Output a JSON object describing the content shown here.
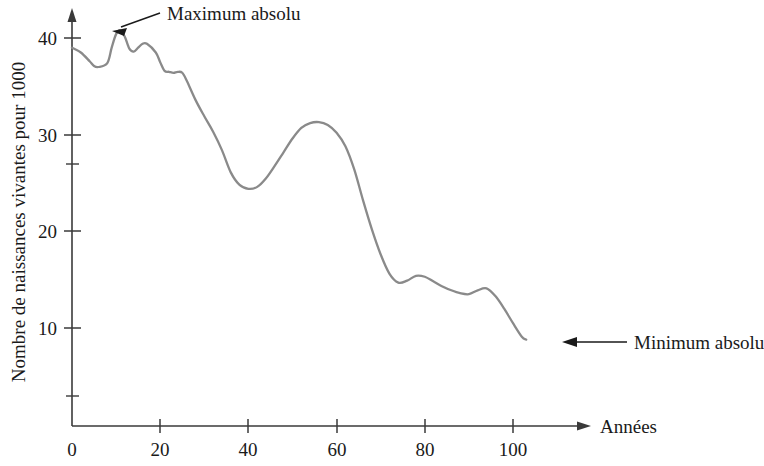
{
  "chart_data": {
    "type": "line",
    "title": "",
    "subtitle": "",
    "xlabel": "Années",
    "ylabel": "Nombre de naissances vivantes pour 1000",
    "xlim": [
      0,
      106
    ],
    "ylim": [
      0,
      43
    ],
    "xticks": [
      0,
      20,
      40,
      60,
      80,
      100
    ],
    "xtick_labels": [
      "0",
      "20",
      "40",
      "60",
      "80",
      "100"
    ],
    "yticks": [
      10,
      20,
      30,
      40
    ],
    "ytick_labels": [
      "10",
      "20",
      "30",
      "40"
    ],
    "yticks_minor": [
      27
    ],
    "grid": false,
    "legend": false,
    "series": [
      {
        "name": "Taux de natalité",
        "color": "#8a8a8a",
        "x": [
          0,
          2,
          4,
          5,
          6,
          8,
          9,
          10,
          11,
          12,
          13,
          14,
          15,
          16,
          17,
          19,
          20,
          21,
          22,
          23,
          24,
          25,
          26,
          28,
          30,
          32,
          34,
          36,
          38,
          40,
          42,
          44,
          46,
          48,
          50,
          52,
          54,
          56,
          58,
          60,
          62,
          64,
          66,
          68,
          70,
          72,
          74,
          76,
          78,
          80,
          82,
          84,
          86,
          88,
          90,
          92,
          94,
          96,
          98,
          100,
          102,
          103
        ],
        "y": [
          39.0,
          38.5,
          37.6,
          37.1,
          37.0,
          37.4,
          39.0,
          40.4,
          40.8,
          40.1,
          38.9,
          38.6,
          39.0,
          39.4,
          39.4,
          38.5,
          37.5,
          36.6,
          36.5,
          36.4,
          36.5,
          36.4,
          35.6,
          33.6,
          31.9,
          30.3,
          28.4,
          26.1,
          24.8,
          24.4,
          24.6,
          25.5,
          26.8,
          28.2,
          29.6,
          30.7,
          31.2,
          31.3,
          31.0,
          30.2,
          28.8,
          26.4,
          23.2,
          20.2,
          17.6,
          15.6,
          14.7,
          14.9,
          15.4,
          15.3,
          14.8,
          14.3,
          13.9,
          13.6,
          13.5,
          13.9,
          14.1,
          13.3,
          12.0,
          10.5,
          9.1,
          8.8
        ]
      }
    ],
    "annotations": [
      {
        "id": "maximum",
        "text": "Maximum absolu",
        "target_x": 11,
        "target_y": 40.8,
        "text_x": 39,
        "text_y": 42.6
      },
      {
        "id": "minimum",
        "text": "Minimum absolu",
        "target_x": 103,
        "target_y": 8.8,
        "text_x": 137,
        "text_y": 8.8
      }
    ]
  },
  "axes": {
    "y_axis_title": "Nombre de naissances vivantes pour 1000",
    "x_axis_title": "Années"
  },
  "colors": {
    "curve": "#8a8a8a",
    "axis": "#3a3a3a",
    "text": "#1a1a1a",
    "annotation": "#1a1a1a",
    "background": "#ffffff"
  }
}
